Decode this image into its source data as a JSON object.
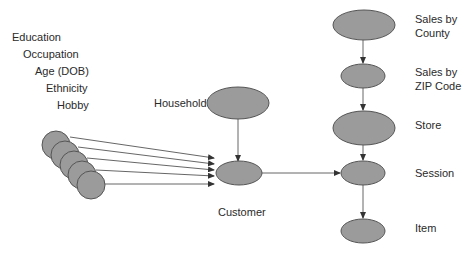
{
  "attributes": [
    "Education",
    "Occupation",
    "Age (DOB)",
    "Ethnicity",
    "Hobby"
  ],
  "nodes": {
    "household": "Household",
    "customer": "Customer",
    "sales_by_county": [
      "Sales by",
      "County"
    ],
    "sales_by_zip": [
      "Sales by",
      "ZIP Code"
    ],
    "store": "Store",
    "session": "Session",
    "item": "Item"
  },
  "colors": {
    "node_fill": "#9b9b9b",
    "node_stroke": "#555555",
    "edge": "#555555",
    "text": "#2a2a2a"
  }
}
